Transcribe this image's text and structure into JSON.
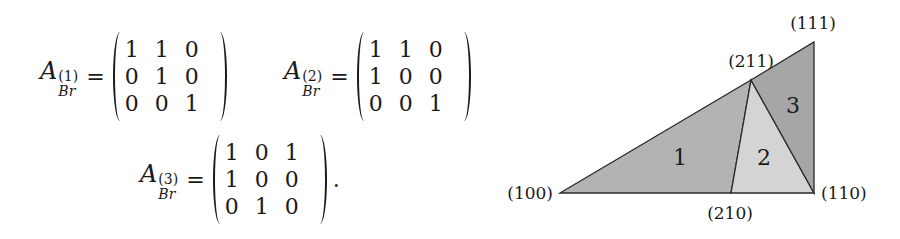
{
  "equations": [
    {
      "symbol": "A",
      "superscript": "(1)",
      "subscript": "Br",
      "equals": "=",
      "matrix": [
        [
          "1",
          "1",
          "0"
        ],
        [
          "0",
          "1",
          "0"
        ],
        [
          "0",
          "0",
          "1"
        ]
      ],
      "trailing": ""
    },
    {
      "symbol": "A",
      "superscript": "(2)",
      "subscript": "Br",
      "equals": "=",
      "matrix": [
        [
          "1",
          "1",
          "0"
        ],
        [
          "1",
          "0",
          "0"
        ],
        [
          "0",
          "0",
          "1"
        ]
      ],
      "trailing": ""
    },
    {
      "symbol": "A",
      "superscript": "(3)",
      "subscript": "Br",
      "equals": "=",
      "matrix": [
        [
          "1",
          "0",
          "1"
        ],
        [
          "1",
          "0",
          "0"
        ],
        [
          "0",
          "1",
          "0"
        ]
      ],
      "trailing": "."
    }
  ],
  "diagram": {
    "vertices": {
      "v100": {
        "label": "(100)",
        "x": 560,
        "y": 193
      },
      "v210": {
        "label": "(210)",
        "x": 731,
        "y": 193
      },
      "v110": {
        "label": "(110)",
        "x": 814,
        "y": 193
      },
      "v211": {
        "label": "(211)",
        "x": 751,
        "y": 80
      },
      "v111": {
        "label": "(111)",
        "x": 814,
        "y": 42
      }
    },
    "regions": [
      {
        "label": "1",
        "color": "#b3b3b3"
      },
      {
        "label": "2",
        "color": "#d4d4d4"
      },
      {
        "label": "3",
        "color": "#a6a6a6"
      }
    ],
    "stroke_color": "#2a2a2a"
  }
}
